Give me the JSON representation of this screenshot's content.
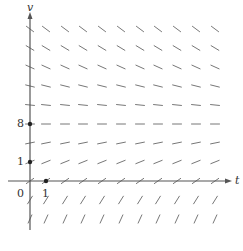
{
  "figure": {
    "type": "slope-field",
    "y_axis_label": "v",
    "x_axis_label": "t",
    "origin_label": "0",
    "y_tick_labels": [
      {
        "value": "8",
        "py": 124
      },
      {
        "value": "1",
        "py": 162
      }
    ],
    "x_tick_labels": [
      {
        "value": "1",
        "px": 46
      }
    ],
    "marked_points": [
      {
        "name": "point-v8",
        "px": 30,
        "py": 124
      },
      {
        "name": "point-v1",
        "px": 30,
        "py": 162
      },
      {
        "name": "point-t1",
        "px": 46,
        "py": 181
      }
    ],
    "grid": {
      "columns_px": [
        30,
        46,
        65,
        83,
        102,
        121,
        140,
        158,
        177,
        196,
        215
      ],
      "rows": [
        {
          "py": 29,
          "slope": -0.75
        },
        {
          "py": 48,
          "slope": -0.6
        },
        {
          "py": 67,
          "slope": -0.45
        },
        {
          "py": 86,
          "slope": -0.25
        },
        {
          "py": 105,
          "slope": -0.1
        },
        {
          "py": 124,
          "slope": 0
        },
        {
          "py": 143,
          "slope": 0.2
        },
        {
          "py": 162,
          "slope": 0.4
        },
        {
          "py": 181,
          "slope": 0.7
        },
        {
          "py": 200,
          "slope": 1.6
        },
        {
          "py": 219,
          "slope": 2.2
        }
      ],
      "segment_length": 9
    },
    "axes": {
      "x_origin_px": 30,
      "y_origin_px": 181,
      "x_axis_end_px": 232,
      "y_axis_top_px": 12,
      "y_axis_bottom_px": 230,
      "x_axis_start_px": 8
    },
    "colors": {
      "axis": "#555555",
      "segment": "#777777",
      "point": "#222222",
      "text": "#333333"
    }
  }
}
